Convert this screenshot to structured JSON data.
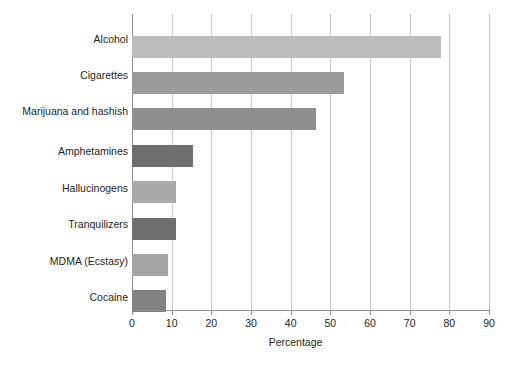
{
  "chart_data": {
    "type": "bar",
    "orientation": "horizontal",
    "title": "",
    "xlabel": "Percentage",
    "ylabel": "",
    "xlim": [
      0,
      90
    ],
    "xticks": [
      0,
      10,
      20,
      30,
      40,
      50,
      60,
      70,
      80,
      90
    ],
    "grid": true,
    "legend": false,
    "categories": [
      "Alcohol",
      "Cigarettes",
      "Marijuana and hashish",
      "Amphetamines",
      "Hallucinogens",
      "Tranquilizers",
      "MDMA (Ecstasy)",
      "Cocaine"
    ],
    "values": [
      78,
      53.5,
      46.5,
      15.5,
      11,
      11,
      9,
      8.5
    ],
    "bar_colors": [
      "#bdbdbd",
      "#9b9b9b",
      "#8f8f8f",
      "#6f6f6f",
      "#a9a9a9",
      "#6f6f6f",
      "#a4a4a4",
      "#828282"
    ]
  },
  "axis": {
    "title": "Percentage",
    "tick_labels": [
      "0",
      "10",
      "20",
      "30",
      "40",
      "50",
      "60",
      "70",
      "80",
      "90"
    ]
  },
  "colors": {
    "gridline": "#c9c9c9",
    "axis": "#8d8d8d",
    "text": "#231f20",
    "background": "#ffffff"
  }
}
